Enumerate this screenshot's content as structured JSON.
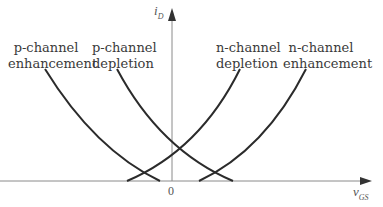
{
  "diagram": {
    "axes": {
      "y_label_main": "i",
      "y_label_sub": "D",
      "x_label_main": "v",
      "x_label_sub": "GS",
      "origin_label": "0"
    },
    "curves": [
      {
        "id": "p-enh",
        "line1": "p-channel",
        "line2": "enhancement"
      },
      {
        "id": "p-dep",
        "line1": "p-channel",
        "line2": "depletion"
      },
      {
        "id": "n-dep",
        "line1": "n-channel",
        "line2": "depletion"
      },
      {
        "id": "n-enh",
        "line1": "n-channel",
        "line2": "enhancement"
      }
    ],
    "colors": {
      "curve": "#2b2b2b",
      "axis": "#888888",
      "text": "#3a3a3a"
    }
  }
}
